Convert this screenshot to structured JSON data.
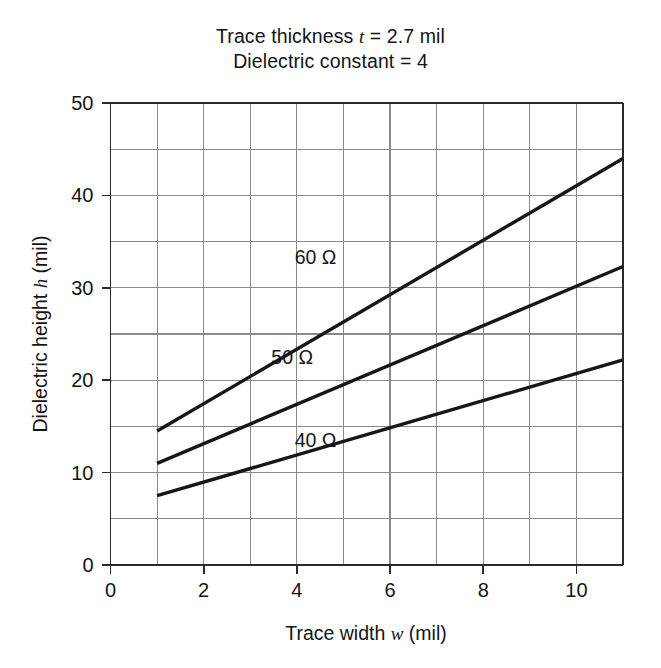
{
  "figure": {
    "title_lines": [
      "Trace thickness t = 2.7 mil",
      "Dielectric constant = 4"
    ],
    "title_line_1_prefix": "Trace thickness ",
    "title_line_1_symbol": "t",
    "title_line_1_suffix": " = 2.7 mil",
    "title_line_2": "Dielectric constant = 4"
  },
  "chart_data": {
    "type": "line",
    "subtitle": "Dielectric constant = 4",
    "xlabel": "Trace width w (mil)",
    "ylabel": "Dielectric height h (mil)",
    "xlabel_prefix": "Trace width ",
    "xlabel_symbol": "w",
    "xlabel_suffix": " (mil)",
    "ylabel_prefix": "Dielectric height ",
    "ylabel_symbol": "h",
    "ylabel_suffix": " (mil)",
    "xlim": [
      0,
      11
    ],
    "ylim": [
      0,
      50
    ],
    "xticks": [
      0,
      2,
      4,
      6,
      8,
      10
    ],
    "xtick_labels": [
      "0",
      "2",
      "4",
      "6",
      "8",
      "10"
    ],
    "yticks": [
      0,
      10,
      20,
      30,
      40,
      50
    ],
    "ytick_labels": [
      "0",
      "10",
      "20",
      "30",
      "40",
      "50"
    ],
    "x_gridlines": [
      0,
      1,
      2,
      3,
      4,
      5,
      6,
      7,
      8,
      9,
      10,
      11
    ],
    "y_gridlines": [
      0,
      5,
      10,
      15,
      20,
      25,
      30,
      35,
      40,
      45,
      50
    ],
    "grid": true,
    "legend": "inline-labels",
    "series": [
      {
        "name": "60 Ω",
        "label": "60 Ω",
        "label_x": 4.4,
        "label_y": 32.6,
        "x": [
          1,
          11
        ],
        "values": [
          14.5,
          44.0
        ]
      },
      {
        "name": "50 Ω",
        "label": "50 Ω",
        "label_x": 3.9,
        "label_y": 21.8,
        "x": [
          1,
          11
        ],
        "values": [
          11.0,
          32.3
        ]
      },
      {
        "name": "40 Ω",
        "label": "40 Ω",
        "label_x": 4.4,
        "label_y": 12.8,
        "x": [
          1,
          11
        ],
        "values": [
          7.5,
          22.2
        ]
      }
    ]
  }
}
